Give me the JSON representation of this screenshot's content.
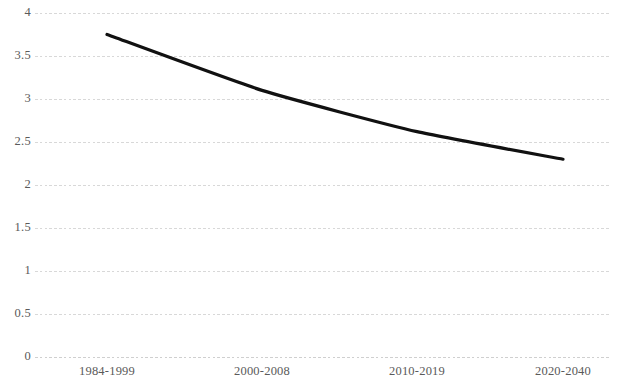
{
  "chart_data": {
    "type": "line",
    "title": "",
    "subtitle": "",
    "xlabel": "",
    "ylabel": "",
    "categories": [
      "1984-1999",
      "2000-2008",
      "2010-2019",
      "2020-2040"
    ],
    "values": [
      3.75,
      3.1,
      2.62,
      2.3
    ],
    "series": [
      {
        "name": "",
        "values": [
          3.75,
          3.1,
          2.62,
          2.3
        ]
      }
    ],
    "ylim": [
      0,
      4
    ],
    "y_ticks": [
      0,
      0.5,
      1,
      1.5,
      2,
      2.5,
      3,
      3.5,
      4
    ],
    "y_tick_labels": [
      "0",
      "0.5",
      "1",
      "1.5",
      "2",
      "2.5",
      "3",
      "3.5",
      "4"
    ],
    "grid": true,
    "grid_axis": "y",
    "grid_style": "dotted",
    "legend": false,
    "legend_position": "none",
    "markers": false,
    "line_color": "#111111",
    "grid_color": "#d8d8d8",
    "tick_label_color": "#5a5a5a",
    "background_color": "#ffffff",
    "smoothing": "curved",
    "annotations": []
  }
}
